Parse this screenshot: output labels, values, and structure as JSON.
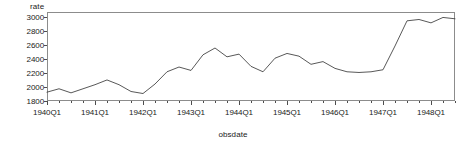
{
  "chart_data": {
    "type": "line",
    "title": "",
    "ylabel": "rate",
    "xlabel": "obsdate",
    "ylim": [
      1750,
      3060
    ],
    "yticks": [
      1800,
      2000,
      2200,
      2400,
      2600,
      2800,
      3000
    ],
    "ytick_labels": [
      "1800",
      "2000",
      "2200",
      "2400",
      "2600",
      "2800",
      "3000"
    ],
    "xlim": [
      1940.0,
      1948.5
    ],
    "xtick_labels": [
      "1940Q1",
      "1941Q1",
      "1942Q1",
      "1943Q1",
      "1944Q1",
      "1945Q1",
      "1946Q1",
      "1947Q1",
      "1948Q1"
    ],
    "xticks": [
      1940.0,
      1941.0,
      1942.0,
      1943.0,
      1944.0,
      1945.0,
      1946.0,
      1947.0,
      1948.0
    ],
    "minor_tick_interval": 0.25,
    "grid": false,
    "legend": null,
    "series_name": "rate",
    "line_color": "#3a3a3a",
    "x": [
      1940.0,
      1940.25,
      1940.5,
      1940.75,
      1941.0,
      1941.25,
      1941.5,
      1941.75,
      1942.0,
      1942.25,
      1942.5,
      1942.75,
      1943.0,
      1943.25,
      1943.5,
      1943.75,
      1944.0,
      1944.25,
      1944.5,
      1944.75,
      1945.0,
      1945.25,
      1945.5,
      1945.75,
      1946.0,
      1946.25,
      1946.5,
      1946.75,
      1947.0,
      1947.25,
      1947.5,
      1947.75,
      1948.0,
      1948.25,
      1948.5
    ],
    "values": [
      1880,
      1930,
      1870,
      1930,
      1990,
      2060,
      1990,
      1890,
      1860,
      2000,
      2180,
      2250,
      2200,
      2430,
      2530,
      2400,
      2440,
      2260,
      2180,
      2380,
      2450,
      2410,
      2290,
      2330,
      2230,
      2180,
      2170,
      2180,
      2210,
      2560,
      2930,
      2950,
      2900,
      2980,
      2960
    ]
  }
}
